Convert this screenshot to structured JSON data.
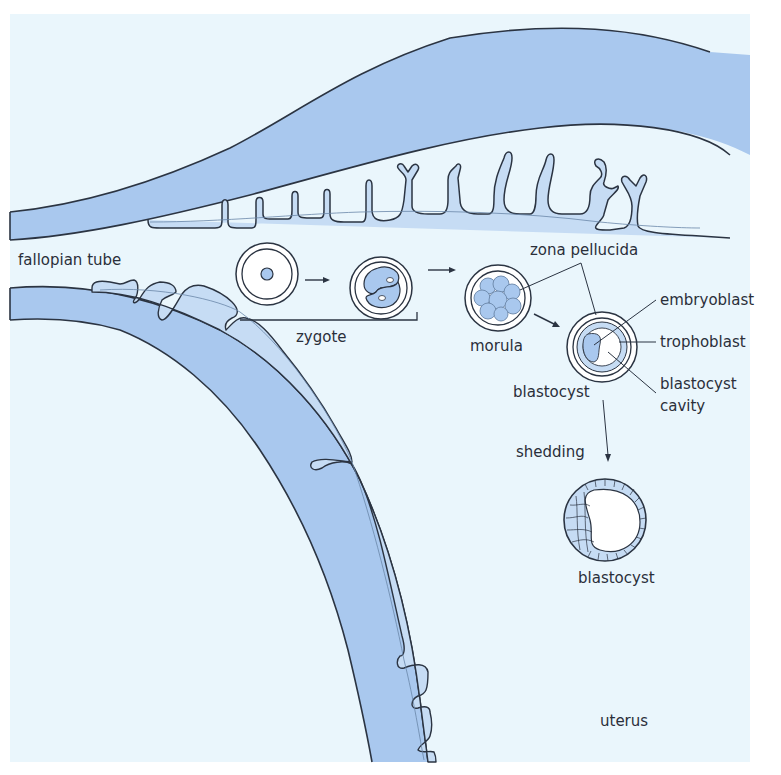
{
  "diagram": {
    "colors": {
      "background": "#eaf6fc",
      "tissue": "#a9c8ee",
      "tissue_light": "#c6dcf4",
      "cell_white": "#ffffff",
      "outline": "#2b3442"
    },
    "labels": {
      "fallopian_tube": "fallopian tube",
      "zygote": "zygote",
      "zona_pellucida": "zona pellucida",
      "morula": "morula",
      "embryoblast": "embryoblast",
      "trophoblast": "trophoblast",
      "blastocyst_1": "blastocyst",
      "blastocyst_cavity_1": "blastocyst",
      "blastocyst_cavity_2": "cavity",
      "shedding": "shedding",
      "blastocyst_2": "blastocyst",
      "uterus": "uterus"
    },
    "stages": [
      {
        "name": "zygote",
        "description": "single cell with nucleus inside zona pellucida"
      },
      {
        "name": "2-cell stage",
        "description": "two cells inside zona pellucida"
      },
      {
        "name": "morula",
        "description": "cluster of cells inside zona pellucida"
      },
      {
        "name": "blastocyst",
        "description": "embryoblast, trophoblast and blastocyst cavity inside zona pellucida"
      },
      {
        "name": "blastocyst",
        "description": "after shedding of zona pellucida"
      }
    ]
  }
}
